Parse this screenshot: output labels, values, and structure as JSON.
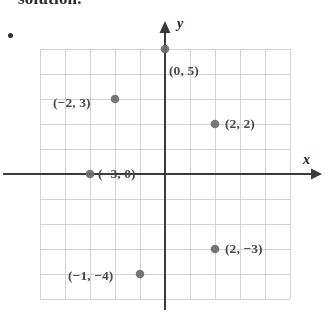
{
  "page": {
    "heading_partial": "solution.",
    "bullet": "•"
  },
  "figure": {
    "name": "coordinate-plane",
    "axis_labels": {
      "x": "x",
      "y": "y"
    },
    "colors": {
      "grid": "#c9ccd1",
      "axis": "#3a3a3a",
      "point": "#6b6b6b",
      "label_text": "#4a4a4a"
    }
  },
  "chart_data": {
    "type": "scatter",
    "title": "",
    "xlabel": "x",
    "ylabel": "y",
    "xlim": [
      -5,
      5
    ],
    "ylim": [
      -5,
      5
    ],
    "grid": true,
    "grid_step": 1,
    "tick_labels_shown": false,
    "legend": "none",
    "points": [
      {
        "label": "(0, 5)",
        "x": 0,
        "y": 5,
        "label_dx": 4,
        "label_dy": 14
      },
      {
        "label": "(−2, 3)",
        "x": -2,
        "y": 3,
        "label_dx": -62,
        "label_dy": -4
      },
      {
        "label": "(−3, 0)",
        "x": -3,
        "y": 0,
        "label_dx": 8,
        "label_dy": -8
      },
      {
        "label": "(2, 2)",
        "x": 2,
        "y": 2,
        "label_dx": 10,
        "label_dy": -8
      },
      {
        "label": "(2, −3)",
        "x": 2,
        "y": -3,
        "label_dx": 10,
        "label_dy": -8
      },
      {
        "label": "(−1, −4)",
        "x": -1,
        "y": -4,
        "label_dx": -72,
        "label_dy": -6
      }
    ]
  }
}
